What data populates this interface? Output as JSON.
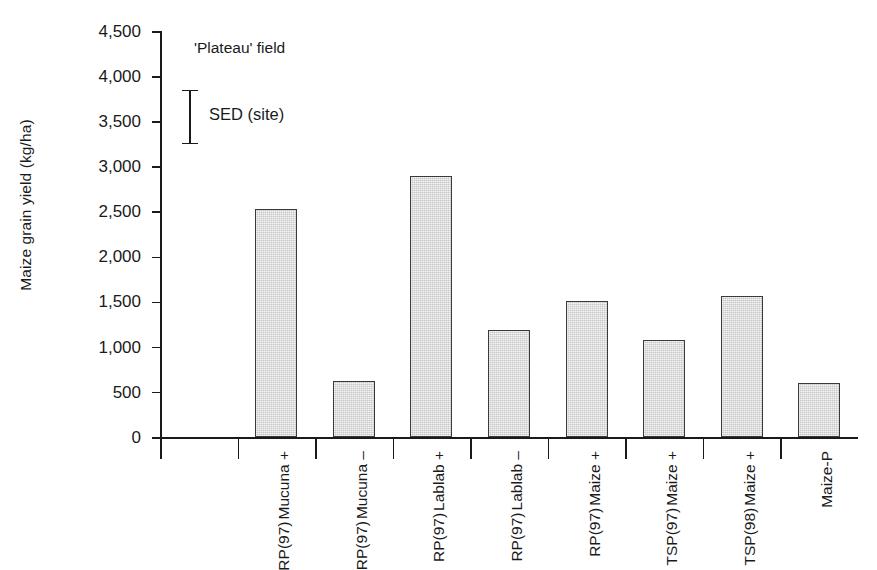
{
  "chart_data": {
    "type": "bar",
    "title": "",
    "annotation_title": "'Plateau' field",
    "xlabel": "",
    "ylabel": "Maize grain yield (kg/ha)",
    "ylim": [
      0,
      4500
    ],
    "ytick_step": 500,
    "grid": false,
    "legend": "none",
    "bar_color": "#d4d4d4",
    "bar_edge_color": "#3a3a3a",
    "categories": [
      "Mucuna + RP(97)",
      "Mucuna – RP(97)",
      "Lablab + RP(97)",
      "Lablab – RP(97)",
      "Maize + RP(97)",
      "Maize + TSP(97)",
      "Maize + TSP(98)",
      "Maize-P"
    ],
    "category_lines": [
      [
        "Mucuna +",
        "RP(97)"
      ],
      [
        "Mucuna –",
        "RP(97)"
      ],
      [
        "Lablab +",
        "RP(97)"
      ],
      [
        "Lablab –",
        "RP(97)"
      ],
      [
        "Maize +",
        "RP(97)"
      ],
      [
        "Maize +",
        "TSP(97)"
      ],
      [
        "Maize +",
        "TSP(98)"
      ],
      [
        "Maize-P",
        ""
      ]
    ],
    "values": [
      2530,
      620,
      2890,
      1190,
      1510,
      1080,
      1560,
      600
    ],
    "ytick_labels": [
      "0",
      "500",
      "1,000",
      "1,500",
      "2,000",
      "2,500",
      "3,000",
      "3,500",
      "4,000",
      "4,500"
    ],
    "ytick_values": [
      0,
      500,
      1000,
      1500,
      2000,
      2500,
      3000,
      3500,
      4000,
      4500
    ],
    "error_indicator": {
      "label": "SED  (site)",
      "low": 3250,
      "high": 3850
    }
  },
  "caption": {
    "text": ""
  }
}
